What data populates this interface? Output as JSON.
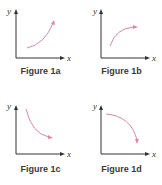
{
  "figures": [
    {
      "id": "1a",
      "caption": "Figure 1a",
      "x_label": "x",
      "y_label": "y",
      "curve": "increasing, concave up"
    },
    {
      "id": "1b",
      "caption": "Figure 1b",
      "x_label": "x",
      "y_label": "y",
      "curve": "increasing, concave down"
    },
    {
      "id": "1c",
      "caption": "Figure 1c",
      "x_label": "x",
      "y_label": "y",
      "curve": "decreasing, concave up"
    },
    {
      "id": "1d",
      "caption": "Figure 1d",
      "x_label": "x",
      "y_label": "y",
      "curve": "decreasing, concave down"
    }
  ],
  "colors": {
    "axis": "#333333",
    "curve": "#d98aa0",
    "caption": "#3a3a3a"
  }
}
